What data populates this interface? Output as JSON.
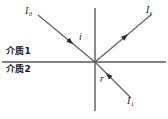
{
  "figure": {
    "kind": "optics-ray-diagram",
    "background_color": "#ffffff",
    "line_color": "#595959",
    "text_color": "#1a1a1a",
    "width": 168,
    "height": 119
  },
  "interface": {
    "origin": {
      "x": 95,
      "y": 62
    },
    "boundary_line": {
      "x1": 2,
      "y1": 62,
      "x2": 166,
      "y2": 62
    },
    "normal_line": {
      "x1": 95,
      "y1": 8,
      "x2": 95,
      "y2": 111
    }
  },
  "media": {
    "upper_label": "介质1",
    "lower_label": "介质2"
  },
  "angles": {
    "incidence_label": "i",
    "refraction_label": "r"
  },
  "rays": [
    {
      "id": "incident",
      "base": "I",
      "subscript": "0",
      "label": "I0",
      "x1": 38,
      "y1": 15,
      "x2": 95,
      "y2": 62,
      "arrow_toward_origin": true,
      "arrow_t": 0.62
    },
    {
      "id": "reflected",
      "base": "I",
      "subscript": "r",
      "label": "Ir",
      "x1": 95,
      "y1": 62,
      "x2": 152,
      "y2": 14,
      "arrow_toward_origin": false,
      "arrow_t": 0.58
    },
    {
      "id": "refracted",
      "base": "I",
      "subscript": "1",
      "label": "I1",
      "x1": 131,
      "y1": 98,
      "x2": 95,
      "y2": 62,
      "arrow_toward_origin": true,
      "arrow_t": 0.7
    }
  ]
}
